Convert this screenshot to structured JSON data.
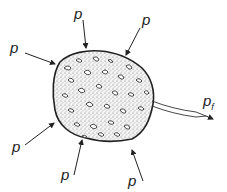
{
  "diagram": {
    "labels": {
      "pressure": "p",
      "fluid_pressure_base": "p",
      "fluid_pressure_sub": "f"
    },
    "pressure_arrows": [
      {
        "label": "p",
        "position": "top"
      },
      {
        "label": "p",
        "position": "top-right"
      },
      {
        "label": "p",
        "position": "left"
      },
      {
        "label": "p",
        "position": "bottom-left"
      },
      {
        "label": "p",
        "position": "bottom"
      },
      {
        "label": "p",
        "position": "bottom-right"
      }
    ],
    "colors": {
      "stroke": "#222222",
      "fill_stipple": "#9a9a9a",
      "background": "#ffffff"
    }
  }
}
